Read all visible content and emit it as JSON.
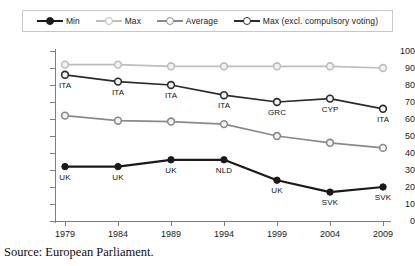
{
  "legend": {
    "entries": [
      {
        "label": "Min",
        "color": "#1a1a1a",
        "marker": "filled-circle"
      },
      {
        "label": "Max",
        "color": "#bdbdbd",
        "marker": "open-circle"
      },
      {
        "label": "Average",
        "color": "#8a8a8a",
        "marker": "open-circle"
      },
      {
        "label": "Max (excl. compulsory voting)",
        "color": "#2b2b2b",
        "marker": "open-circle"
      }
    ]
  },
  "caption": {
    "text": "Source: European Parliament."
  },
  "chart_data": {
    "type": "line",
    "title": "",
    "xlabel": "",
    "ylabel": "",
    "categories": [
      "1979",
      "1984",
      "1989",
      "1994",
      "1999",
      "2004",
      "2009"
    ],
    "ylim": [
      0,
      100
    ],
    "yticks": [
      0,
      10,
      20,
      30,
      40,
      50,
      60,
      70,
      80,
      90,
      100
    ],
    "grid": false,
    "legend_position": "top",
    "series": [
      {
        "name": "Min",
        "color": "#1a1a1a",
        "marker": "filled-circle",
        "values": [
          32,
          32,
          36,
          36,
          24,
          17,
          20
        ],
        "point_labels": [
          "UK",
          "UK",
          "UK",
          "NLD",
          "UK",
          "SVK",
          "SVK"
        ]
      },
      {
        "name": "Max",
        "color": "#bdbdbd",
        "marker": "open-circle",
        "values": [
          92,
          92,
          91,
          91,
          91,
          91,
          90
        ],
        "point_labels": [
          "",
          "",
          "",
          "",
          "",
          "",
          ""
        ]
      },
      {
        "name": "Average",
        "color": "#8a8a8a",
        "marker": "open-circle",
        "values": [
          62,
          59,
          58.5,
          57,
          50,
          46,
          43
        ],
        "point_labels": [
          "",
          "",
          "",
          "",
          "",
          "",
          ""
        ]
      },
      {
        "name": "Max (excl. compulsory voting)",
        "color": "#2b2b2b",
        "marker": "open-circle",
        "values": [
          86,
          82,
          80,
          74,
          70,
          72,
          66
        ],
        "point_labels": [
          "ITA",
          "ITA",
          "ITA",
          "ITA",
          "GRC",
          "CYP",
          "ITA"
        ]
      }
    ]
  }
}
